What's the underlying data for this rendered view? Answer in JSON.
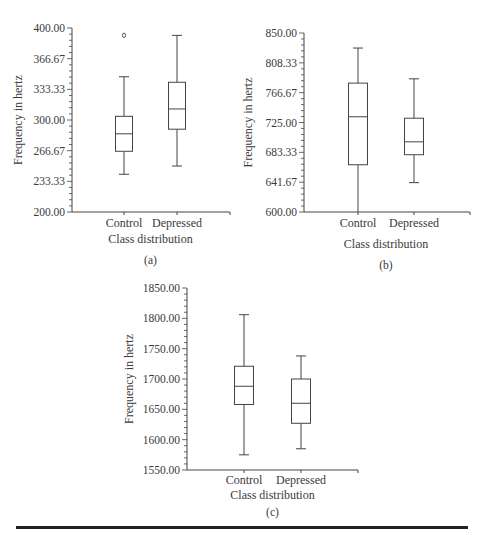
{
  "chart_data": [
    {
      "id": "a",
      "type": "box",
      "panel_label": "(a)",
      "xlabel": "Class distribution",
      "ylabel": "Frequency in hertz",
      "ylim": [
        200.0,
        400.0
      ],
      "yticks": [
        "200.00",
        "233.33",
        "266.67",
        "300.00",
        "333.33",
        "366.67",
        "400.00"
      ],
      "categories": [
        "Control",
        "Depressed"
      ],
      "series": [
        {
          "name": "Control",
          "whisker_low": 241,
          "q1": 266,
          "median": 285,
          "q3": 304,
          "whisker_high": 347,
          "outliers": [
            392
          ]
        },
        {
          "name": "Depressed",
          "whisker_low": 250,
          "q1": 290,
          "median": 312,
          "q3": 341,
          "whisker_high": 392,
          "outliers": []
        }
      ],
      "grid": false
    },
    {
      "id": "b",
      "type": "box",
      "panel_label": "(b)",
      "xlabel": "Class distribution",
      "ylabel": "Frequency in hertz",
      "ylim": [
        600.0,
        850.0
      ],
      "yticks": [
        "600.00",
        "641.67",
        "683.33",
        "725.00",
        "766.67",
        "808.33",
        "850.00"
      ],
      "categories": [
        "Control",
        "Depressed"
      ],
      "series": [
        {
          "name": "Control",
          "whisker_low": 600,
          "q1": 666,
          "median": 733,
          "q3": 780,
          "whisker_high": 829,
          "outliers": []
        },
        {
          "name": "Depressed",
          "whisker_low": 641,
          "q1": 680,
          "median": 698,
          "q3": 731,
          "whisker_high": 786,
          "outliers": []
        }
      ],
      "grid": false
    },
    {
      "id": "c",
      "type": "box",
      "panel_label": "(c)",
      "xlabel": "Class distribution",
      "ylabel": "Frequency in hertz",
      "ylim": [
        1550.0,
        1850.0
      ],
      "yticks": [
        "1550.00",
        "1600.00",
        "1650.00",
        "1700.00",
        "1750.00",
        "1800.00",
        "1850.00"
      ],
      "categories": [
        "Control",
        "Depressed"
      ],
      "series": [
        {
          "name": "Control",
          "whisker_low": 1575,
          "q1": 1658,
          "median": 1688,
          "q3": 1721,
          "whisker_high": 1806,
          "outliers": []
        },
        {
          "name": "Depressed",
          "whisker_low": 1585,
          "q1": 1627,
          "median": 1660,
          "q3": 1700,
          "whisker_high": 1738,
          "outliers": []
        }
      ],
      "grid": false
    }
  ]
}
